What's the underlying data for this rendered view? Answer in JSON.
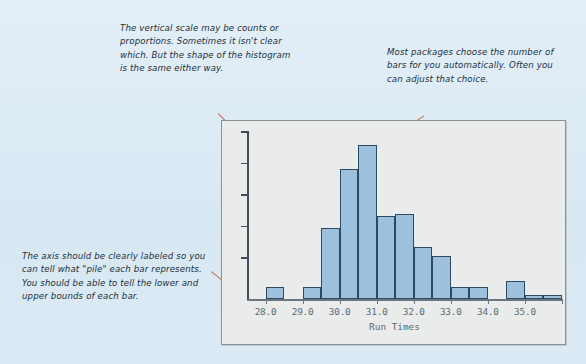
{
  "notes": {
    "top_left": "The vertical scale may be counts or proportions. Sometimes it isn't clear which. But the shape of the histogram is the same either way.",
    "top_right": "Most packages choose the number of bars for you automatically. Often you can adjust that choice.",
    "bottom_left": "The axis should be clearly labeled so you can tell what \"pile\" each bar represents. You should be able to tell the lower and upper bounds of each bar."
  },
  "colors": {
    "page_background": "#dceaf4",
    "panel_background": "#e9ecea",
    "panel_border": "#8c9196",
    "bar_fill": "#9dc0dd",
    "bar_stroke": "#2e4a63",
    "axis": "#3f4e58",
    "tick_label": "#5d6a73",
    "leader_line": "#c0694a",
    "note_text": "#20303c"
  },
  "chart_data": {
    "type": "bar",
    "title": "",
    "xlabel": "Run Times",
    "ylabel": "",
    "grid": false,
    "legend": null,
    "xlim": [
      27.5,
      36.0
    ],
    "ylim": [
      0,
      14
    ],
    "y_axis_labeled": false,
    "y_tick_count": 5,
    "bin_width": 0.5,
    "x_tick_labels": [
      "28.0",
      "29.0",
      "30.0",
      "31.0",
      "32.0",
      "33.0",
      "34.0",
      "35.0"
    ],
    "x_tick_values": [
      28.0,
      29.0,
      30.0,
      31.0,
      32.0,
      33.0,
      34.0,
      35.0
    ],
    "bin_left_edges": [
      27.5,
      28.0,
      28.5,
      29.0,
      29.5,
      30.0,
      30.5,
      31.0,
      31.5,
      32.0,
      32.5,
      33.0,
      33.5,
      34.0,
      34.5,
      35.0,
      35.5
    ],
    "categories": [
      "27.5-28.0",
      "28.0-28.5",
      "28.5-29.0",
      "29.0-29.5",
      "29.5-30.0",
      "30.0-30.5",
      "30.5-31.0",
      "31.0-31.5",
      "31.5-32.0",
      "32.0-32.5",
      "32.5-33.0",
      "33.0-33.5",
      "33.5-34.0",
      "34.0-34.5",
      "34.5-35.0",
      "35.0-35.5",
      "35.5-36.0"
    ],
    "values": [
      0,
      1,
      0,
      1,
      6,
      11,
      13,
      7,
      7.2,
      4.4,
      3.6,
      1,
      1,
      0,
      1.5,
      0.3,
      0.3
    ]
  }
}
